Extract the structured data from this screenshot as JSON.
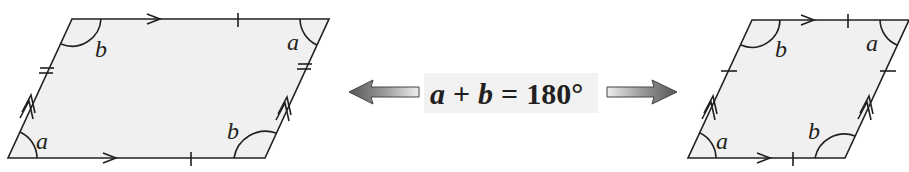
{
  "colors": {
    "shape_fill": "#f0f0f0",
    "stroke": "#231f20",
    "arrow_dark": "#555555",
    "arrow_light": "#e8e8e8"
  },
  "equation": {
    "a": "a",
    "plus": "+",
    "b": "b",
    "equals": "=",
    "value": "180°"
  },
  "left_parallelogram": {
    "angles": {
      "bottom_left": "a",
      "top_left": "b",
      "top_right": "a",
      "bottom_right": "b"
    },
    "marks": {
      "horizontal_sides": "single-tick, single-arrow",
      "slanted_sides": "double-tick, double-arrow"
    }
  },
  "right_parallelogram": {
    "angles": {
      "bottom_left": "a",
      "top_left": "b",
      "top_right": "a",
      "bottom_right": "b"
    },
    "marks": {
      "horizontal_sides": "single-tick, single-arrow",
      "slanted_sides": "single-tick, double-arrow"
    }
  },
  "icons": {
    "left_arrow": "left-arrow-icon",
    "right_arrow": "right-arrow-icon"
  }
}
